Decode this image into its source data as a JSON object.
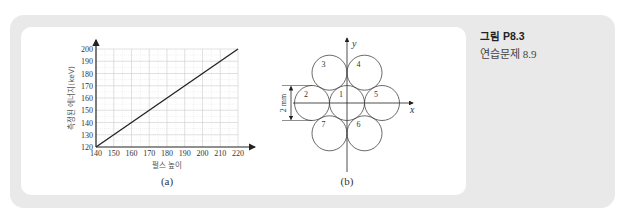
{
  "caption": {
    "figure_label": "그림 P8.3",
    "subtitle": "연습문제 8.9"
  },
  "colors": {
    "frame": "#e9e9e9",
    "panel": "#ffffff",
    "line": "#222222",
    "grid": "#cccccc"
  },
  "chart_data": {
    "type": "line",
    "panel_label": "(a)",
    "title": "",
    "xlabel": "펄스 높이",
    "ylabel": "측정된 에너지(keV)",
    "xlim": [
      140,
      220
    ],
    "ylim": [
      120,
      200
    ],
    "xticks": [
      140,
      150,
      160,
      170,
      180,
      190,
      200,
      210,
      220
    ],
    "yticks": [
      120,
      130,
      140,
      150,
      160,
      170,
      180,
      190,
      200
    ],
    "grid": true,
    "series": [
      {
        "name": "calibration",
        "x": [
          140,
          220
        ],
        "y": [
          120,
          200
        ]
      }
    ]
  },
  "diagram": {
    "panel_label": "(b)",
    "x_axis_label": "x",
    "y_axis_label": "y",
    "dimension_label": "2 mm",
    "circles": [
      {
        "label": "1",
        "pos": [
          0,
          0
        ]
      },
      {
        "label": "2",
        "pos": [
          -2,
          0
        ]
      },
      {
        "label": "3",
        "pos": [
          -1,
          1.732
        ]
      },
      {
        "label": "4",
        "pos": [
          1,
          1.732
        ]
      },
      {
        "label": "5",
        "pos": [
          2,
          0
        ]
      },
      {
        "label": "6",
        "pos": [
          1,
          -1.732
        ]
      },
      {
        "label": "7",
        "pos": [
          -1,
          -1.732
        ]
      }
    ]
  }
}
